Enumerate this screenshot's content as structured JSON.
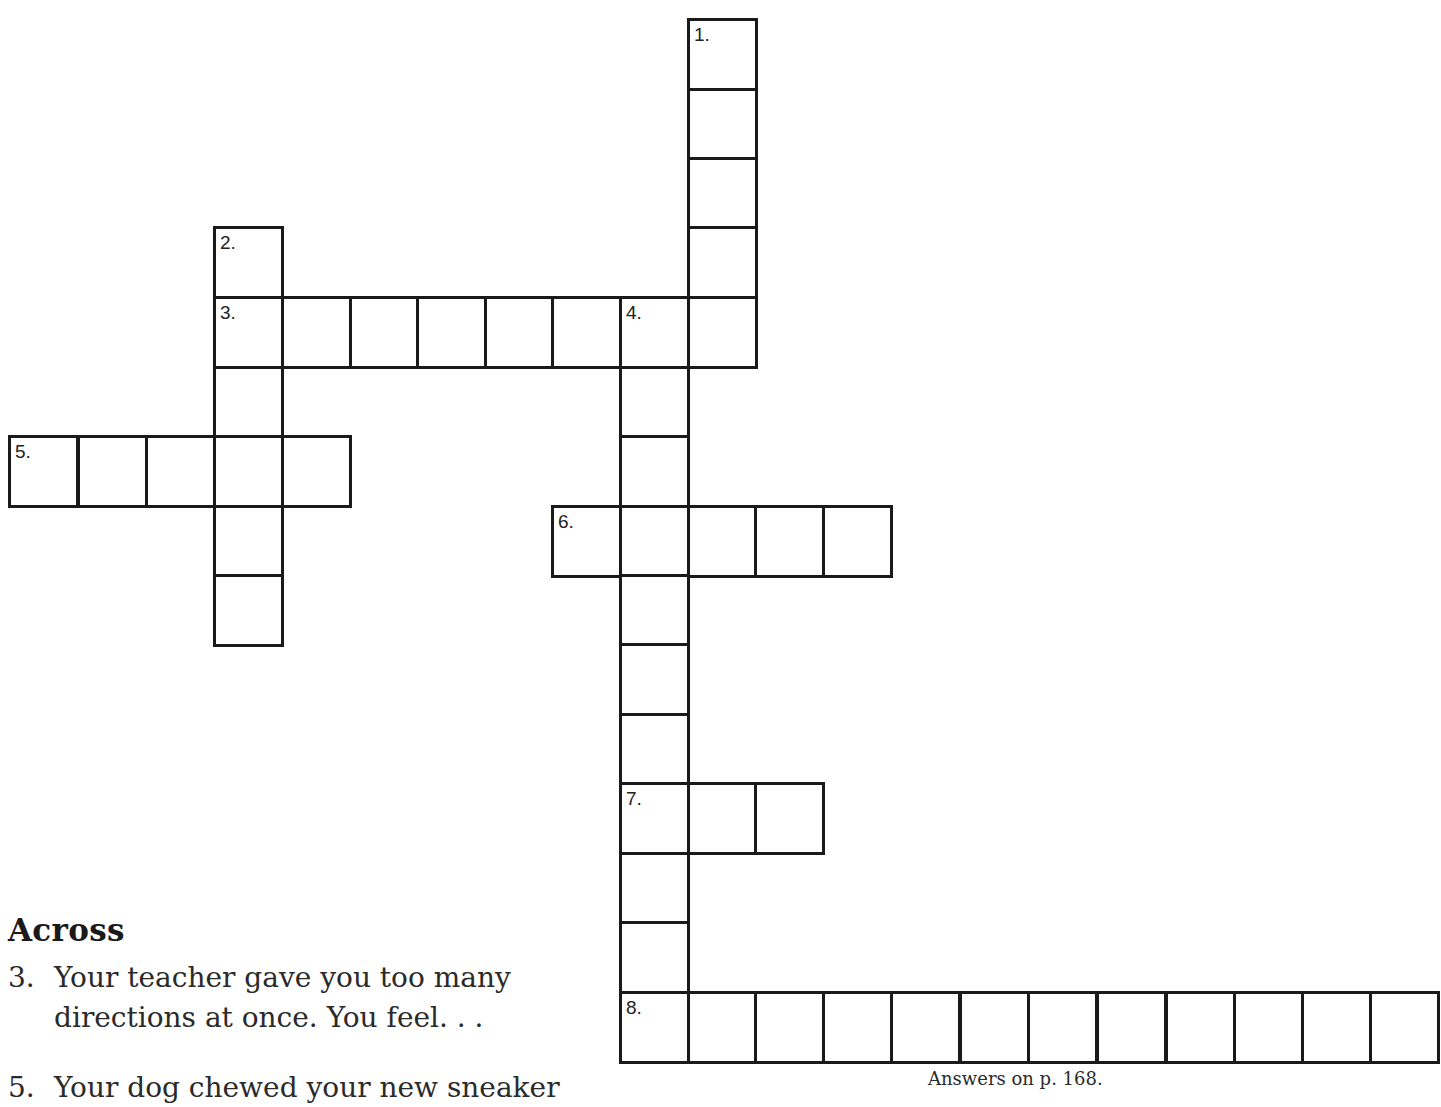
{
  "puzzle": {
    "grid_origin": {
      "x": 8,
      "y": 18
    },
    "col_x": [
      8,
      77,
      145,
      213,
      281,
      349,
      416,
      484,
      551,
      619,
      687,
      754,
      822,
      890,
      959,
      1027,
      1096,
      1165,
      1233,
      1301,
      1369
    ],
    "row_y": [
      18,
      88,
      157,
      226,
      296,
      366,
      435,
      505,
      574,
      643,
      713,
      782,
      852,
      921,
      991
    ],
    "entries": [
      {
        "number": "1.",
        "direction": "down",
        "row": 0,
        "col": 10,
        "length": 5
      },
      {
        "number": "2.",
        "direction": "down",
        "row": 3,
        "col": 3,
        "length": 6
      },
      {
        "number": "3.",
        "direction": "across",
        "row": 4,
        "col": 3,
        "length": 8
      },
      {
        "number": "4.",
        "direction": "down",
        "row": 4,
        "col": 9,
        "length": 11
      },
      {
        "number": "5.",
        "direction": "across",
        "row": 6,
        "col": 0,
        "length": 5
      },
      {
        "number": "6.",
        "direction": "across",
        "row": 7,
        "col": 8,
        "length": 5
      },
      {
        "number": "7.",
        "direction": "across",
        "row": 11,
        "col": 9,
        "length": 3
      },
      {
        "number": "8.",
        "direction": "across",
        "row": 14,
        "col": 9,
        "length": 12
      }
    ]
  },
  "clues": {
    "heading": "Across",
    "items": [
      {
        "number": "3.",
        "line1": "Your teacher gave you too many",
        "line2": "directions at once.  You feel. . ."
      },
      {
        "number": "5.",
        "line1": "Your dog chewed your new sneaker",
        "line2": ""
      }
    ]
  },
  "footer": {
    "answers_note": "Answers on p. 168."
  }
}
